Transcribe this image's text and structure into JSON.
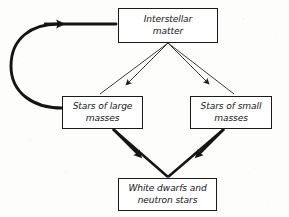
{
  "diagram": {
    "background_color": "#fdfdfc",
    "ink_color": "#1a1a1a",
    "nodes": [
      {
        "id": "interstellar",
        "name": "interstellar-matter",
        "line1": "Interstellar",
        "line2": "matter"
      },
      {
        "id": "large",
        "name": "stars-of-large-masses",
        "line1": "Stars of large",
        "line2": "masses"
      },
      {
        "id": "small",
        "name": "stars-of-small-masses",
        "line1": "Stars of small",
        "line2": "masses"
      },
      {
        "id": "remnants",
        "name": "white-dwarfs-and-neutron-stars",
        "line1": "White dwarfs and",
        "line2": "neutron stars"
      }
    ],
    "edges": [
      {
        "name": "edge-interstellar-to-large",
        "from": "interstellar",
        "to": "large",
        "style": "thin",
        "arrowhead": "midpoint"
      },
      {
        "name": "edge-interstellar-to-small",
        "from": "interstellar",
        "to": "small",
        "style": "thin",
        "arrowhead": "midpoint"
      },
      {
        "name": "edge-large-to-remnants",
        "from": "large",
        "to": "remnants",
        "style": "bold",
        "arrowhead": "midpoint"
      },
      {
        "name": "edge-small-to-remnants",
        "from": "small",
        "to": "remnants",
        "style": "bold",
        "arrowhead": "midpoint"
      },
      {
        "name": "edge-large-to-interstellar-feedback",
        "from": "large",
        "to": "interstellar",
        "style": "bold-curved",
        "arrowhead": "end"
      }
    ]
  }
}
